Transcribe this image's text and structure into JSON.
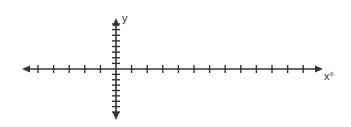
{
  "diagram": {
    "type": "coordinate-axes",
    "x_axis": {
      "label": "x°",
      "ticks_left_of_origin": 5,
      "ticks_right_of_origin": 12,
      "arrow_left": true,
      "arrow_right": true
    },
    "y_axis": {
      "label": "y",
      "ticks_above_origin": 8,
      "ticks_below_origin": 8,
      "arrow_up": true,
      "arrow_down": true
    },
    "line_color": "#333333",
    "background": "#ffffff"
  }
}
